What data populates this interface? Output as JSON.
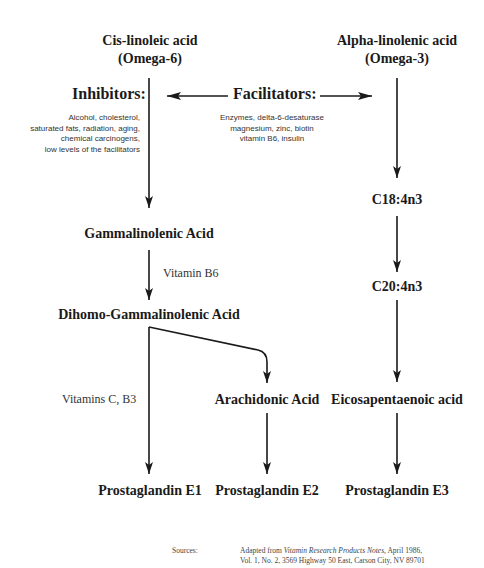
{
  "omega6": {
    "line1": "Cis-linoleic acid",
    "line2": "(Omega-6)"
  },
  "omega3": {
    "line1": "Alpha-linolenic acid",
    "line2": "(Omega-3)"
  },
  "inhibitors": {
    "heading": "Inhibitors:",
    "items": [
      "Alcohol, cholesterol,",
      "saturated fats, radiation, aging,",
      "chemical carcinogens,",
      "low levels of the facilitators"
    ]
  },
  "facilitators": {
    "heading": "Facilitators:",
    "items": [
      "Enzymes, delta-6-desaturase",
      "magnesium, zinc, biotin",
      "vitamin B6, insulin"
    ]
  },
  "nodes": {
    "gla": "Gammalinolenic Acid",
    "dgla": "Dihomo-Gammalinolenic Acid",
    "aa": "Arachidonic Acid",
    "pge1": "Prostaglandin E1",
    "pge2": "Prostaglandin E2",
    "c18": "C18:4n3",
    "c20": "C20:4n3",
    "epa": "Eicosapentaenoic acid",
    "pge3": "Prostaglandin E3"
  },
  "labels": {
    "vitamin_b6": "Vitamin B6",
    "vitamins_c_b3": "Vitamins C, B3"
  },
  "source": {
    "label": "Sources:",
    "line1_prefix": "Adapted from ",
    "line1_title": "Vitamin Research Products Notes,",
    "line1_suffix": " April 1986,",
    "line2": "Vol. 1, No. 2, 3569 Highway 50 East, Carson City, NV 89701"
  },
  "colors": {
    "line": "#1a1a1a",
    "text": "#1a1a1a"
  }
}
